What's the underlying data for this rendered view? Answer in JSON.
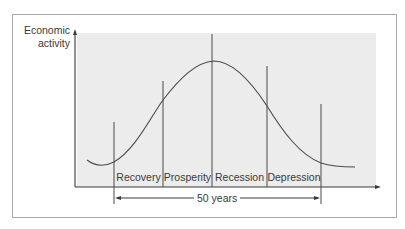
{
  "diagram": {
    "type": "economic-long-wave-cycle",
    "y_axis_label_line1": "Economic",
    "y_axis_label_line2": "activity",
    "phases": [
      {
        "label": "Recovery"
      },
      {
        "label": "Prosperity"
      },
      {
        "label": "Recession"
      },
      {
        "label": "Depression"
      }
    ],
    "span_label": "50 years",
    "colors": {
      "shade": "#ececec",
      "line": "#4a4a4a",
      "frame": "#a8a8a8",
      "text": "#3a3a3a"
    }
  }
}
